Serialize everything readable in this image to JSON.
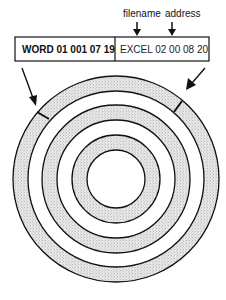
{
  "labels": {
    "filename": "filename",
    "address": "address"
  },
  "directory_entry": {
    "cells": [
      {
        "text": "WORD 01 001 07 19",
        "bold": true
      },
      {
        "text": "EXCEL 02 00 08 20",
        "bold": false
      }
    ]
  },
  "disk": {
    "track_count": 3,
    "description": "concentric tracks with two marked sectors"
  },
  "colors": {
    "ink": "#111111",
    "track_fill": "#d8d8d8",
    "gap_fill": "#ffffff"
  }
}
